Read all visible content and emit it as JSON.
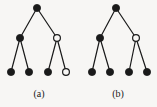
{
  "figure": {
    "width": 157,
    "height": 107,
    "background_color": "#f7f6f4",
    "edge_color": "#1a1a1a",
    "node_fill_filled": "#1a1a1a",
    "node_fill_hollow": "#f7f6f4",
    "node_stroke": "#1a1a1a"
  },
  "panels": [
    {
      "id": "a",
      "caption": "(a)",
      "nodes": [
        {
          "id": "a-root",
          "name": "root-node",
          "x": 37,
          "y": 8,
          "r": 3.6,
          "filled": true
        },
        {
          "id": "a-l",
          "name": "left-internal-node",
          "x": 20,
          "y": 38,
          "r": 3.6,
          "filled": true
        },
        {
          "id": "a-r",
          "name": "right-internal-node",
          "x": 57,
          "y": 38,
          "r": 3.4,
          "filled": false
        },
        {
          "id": "a-ll",
          "name": "leaf-node-1",
          "x": 11,
          "y": 72,
          "r": 3.6,
          "filled": true
        },
        {
          "id": "a-lr",
          "name": "leaf-node-2",
          "x": 29,
          "y": 72,
          "r": 3.6,
          "filled": true
        },
        {
          "id": "a-rl",
          "name": "leaf-node-3",
          "x": 48,
          "y": 72,
          "r": 3.6,
          "filled": true
        },
        {
          "id": "a-rr",
          "name": "leaf-node-4",
          "x": 66,
          "y": 72,
          "r": 3.4,
          "filled": false
        }
      ],
      "edges": [
        {
          "name": "edge-root-left",
          "from": "a-root",
          "to": "a-l"
        },
        {
          "name": "edge-root-right",
          "from": "a-root",
          "to": "a-r"
        },
        {
          "name": "edge-left-leaf-1",
          "from": "a-l",
          "to": "a-ll"
        },
        {
          "name": "edge-left-leaf-2",
          "from": "a-l",
          "to": "a-lr"
        },
        {
          "name": "edge-right-leaf-3",
          "from": "a-r",
          "to": "a-rl"
        },
        {
          "name": "edge-right-leaf-4",
          "from": "a-r",
          "to": "a-rr"
        }
      ]
    },
    {
      "id": "b",
      "caption": "(b)",
      "nodes": [
        {
          "id": "b-root",
          "name": "root-node",
          "x": 116,
          "y": 8,
          "r": 3.6,
          "filled": true
        },
        {
          "id": "b-l",
          "name": "left-internal-node",
          "x": 100,
          "y": 38,
          "r": 3.6,
          "filled": true
        },
        {
          "id": "b-r",
          "name": "right-internal-node",
          "x": 136,
          "y": 38,
          "r": 3.4,
          "filled": false
        },
        {
          "id": "b-ll",
          "name": "leaf-node-1",
          "x": 92,
          "y": 72,
          "r": 3.6,
          "filled": true
        },
        {
          "id": "b-lr",
          "name": "leaf-node-2",
          "x": 110,
          "y": 72,
          "r": 3.6,
          "filled": true
        },
        {
          "id": "b-rl",
          "name": "leaf-node-3",
          "x": 129,
          "y": 72,
          "r": 3.6,
          "filled": true
        },
        {
          "id": "b-rr",
          "name": "leaf-node-4",
          "x": 147,
          "y": 72,
          "r": 3.6,
          "filled": true
        }
      ],
      "edges": [
        {
          "name": "edge-root-left",
          "from": "b-root",
          "to": "b-l"
        },
        {
          "name": "edge-root-right",
          "from": "b-root",
          "to": "b-r"
        },
        {
          "name": "edge-left-leaf-1",
          "from": "b-l",
          "to": "b-ll"
        },
        {
          "name": "edge-left-leaf-2",
          "from": "b-l",
          "to": "b-lr"
        },
        {
          "name": "edge-right-leaf-3",
          "from": "b-r",
          "to": "b-rl"
        },
        {
          "name": "edge-right-leaf-4",
          "from": "b-r",
          "to": "b-rr"
        }
      ]
    }
  ]
}
